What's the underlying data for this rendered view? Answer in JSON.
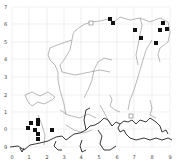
{
  "map": {
    "frame": {
      "left": 12,
      "top": 7,
      "right": 170,
      "bottom": 147
    },
    "grid_color": "#e6e6e6",
    "coast_color": "#222222",
    "river_color": "#9a9a9a",
    "y_ticks": [
      {
        "label": "7",
        "y": 7
      },
      {
        "label": "6",
        "y": 24
      },
      {
        "label": "5",
        "y": 42
      },
      {
        "label": "4",
        "y": 59
      },
      {
        "label": "3",
        "y": 77
      },
      {
        "label": "2",
        "y": 95
      },
      {
        "label": "1",
        "y": 112
      },
      {
        "label": "0",
        "y": 129
      },
      {
        "label": "9",
        "y": 147
      }
    ],
    "x_ticks": [
      {
        "label": "0",
        "x": 12
      },
      {
        "label": "1",
        "x": 29
      },
      {
        "label": "2",
        "x": 47
      },
      {
        "label": "3",
        "x": 64
      },
      {
        "label": "4",
        "x": 81
      },
      {
        "label": "5",
        "x": 99
      },
      {
        "label": "6",
        "x": 117
      },
      {
        "label": "7",
        "x": 134
      },
      {
        "label": "8",
        "x": 152
      },
      {
        "label": "9",
        "x": 170
      }
    ],
    "filled_markers": [
      [
        110,
        19
      ],
      [
        113,
        23
      ],
      [
        135,
        30
      ],
      [
        141,
        38
      ],
      [
        156,
        43
      ],
      [
        160,
        30
      ],
      [
        163,
        23
      ],
      [
        167,
        29
      ],
      [
        31,
        123
      ],
      [
        38,
        120
      ],
      [
        38,
        124
      ],
      [
        28,
        128
      ],
      [
        35,
        130
      ],
      [
        38,
        134
      ],
      [
        38,
        139
      ],
      [
        52,
        130
      ]
    ],
    "open_markers": [
      [
        91,
        23
      ],
      [
        131,
        116
      ]
    ]
  }
}
